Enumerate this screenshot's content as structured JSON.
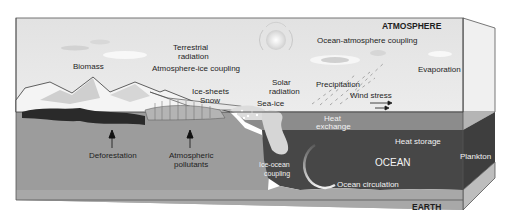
{
  "diagram": {
    "type": "climate-system-cross-section",
    "regions": {
      "atmosphere": "ATMOSPHERE",
      "ocean": "OCEAN",
      "earth": "EARTH"
    },
    "labels": {
      "biomass": "Biomass",
      "terrestrial_radiation_1": "Terrestrial",
      "terrestrial_radiation_2": "radiation",
      "atmosphere_ice_coupling": "Atmosphere-ice coupling",
      "ice_sheets": "Ice-sheets",
      "snow": "Snow",
      "solar_radiation_1": "Solar",
      "solar_radiation_2": "radiation",
      "sea_ice": "Sea-ice",
      "ocean_atmosphere_coupling": "Ocean-atmosphere coupling",
      "precipitation": "Precipitation",
      "evaporation": "Evaporation",
      "wind_stress": "Wind stress",
      "heat_exchange_1": "Heat",
      "heat_exchange_2": "exchange",
      "heat_storage": "Heat storage",
      "plankton": "Plankton",
      "ice_ocean_coupling_1": "Ice-ocean",
      "ice_ocean_coupling_2": "coupling",
      "ocean_circulation": "Ocean circulation",
      "deforestation": "Deforestation",
      "atmospheric_pollutants_1": "Atmospheric",
      "atmospheric_pollutants_2": "pollutants"
    },
    "colors": {
      "sky": "#e6e6e6",
      "land": "#9a9a9a",
      "ocean_surface": "#8a8a8a",
      "ocean_deep": "#4a4a4a",
      "earth_band": "#a8a8a8",
      "side_face": "#bdbdbd",
      "outline": "#3a3a3a"
    }
  }
}
